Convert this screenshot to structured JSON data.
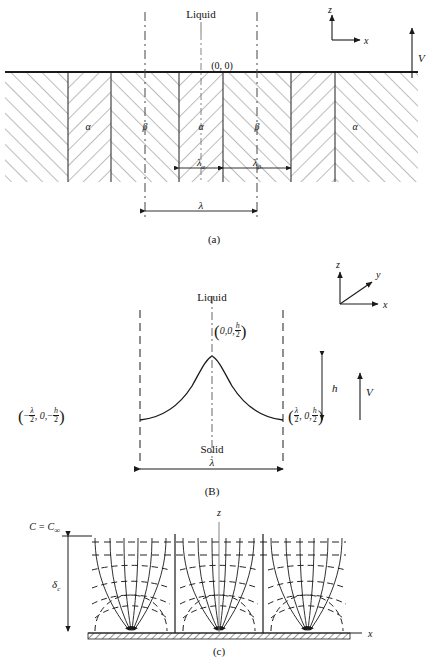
{
  "figure": {
    "panels": [
      "a",
      "B",
      "c"
    ]
  },
  "panel_a": {
    "caption": "(a)",
    "liquid_label": "Liquid",
    "origin_label": "(0, 0)",
    "axis_z": "z",
    "axis_x": "x",
    "velocity_label": "V",
    "phase_alpha": "α",
    "phase_beta": "β",
    "lambda_alpha": "λ",
    "lambda_alpha_sub": "α",
    "lambda_beta": "λ",
    "lambda_beta_sub": "β",
    "lambda_total": "λ",
    "phase_sequence": [
      "α",
      "β",
      "α",
      "β",
      "α"
    ]
  },
  "panel_b": {
    "caption": "(B)",
    "liquid_label": "Liquid",
    "solid_label": "Solid",
    "axis_z": "z",
    "axis_y": "y",
    "axis_x": "x",
    "velocity_label": "V",
    "height_label": "h",
    "lambda_total": "λ",
    "point_top": {
      "x": "0,",
      "y": "0,",
      "z_num": "h",
      "z_den": "2"
    },
    "point_left": {
      "x_sign": "−",
      "x_num": "λ",
      "x_den": "2",
      "y": "0,",
      "z_sign": "−",
      "z_num": "h",
      "z_den": "2"
    },
    "point_right": {
      "x_num": "λ",
      "x_den": "2",
      "y": "0,",
      "z_num": "h",
      "z_den": "2"
    }
  },
  "panel_c": {
    "caption": "(c)",
    "concentration_label": "C = C",
    "concentration_sub": "∞",
    "delta_label": "δ",
    "delta_sub": "c",
    "axis_z": "z",
    "axis_x": "x",
    "description": "diffusion flux lines converging to lamella sinks with dashed iso-concentration contours"
  },
  "colors": {
    "ink": "#1a1a1a",
    "hatch": "#6b6b6b",
    "dash": "#3a3a3a",
    "background": "#ffffff"
  }
}
